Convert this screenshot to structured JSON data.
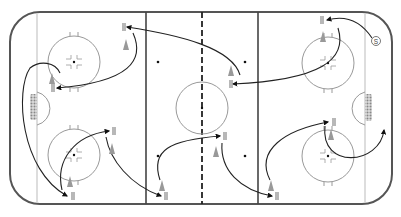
{
  "diagram": {
    "type": "hockey-rink-drill",
    "rink": {
      "x": 10,
      "y": 12,
      "width": 382,
      "height": 192,
      "corner_radius": 30
    },
    "lines": {
      "left_goal_line_x": 37,
      "right_goal_line_x": 365,
      "left_blue_line_x": 146,
      "right_blue_line_x": 258,
      "center_red_line_x": 202
    },
    "faceoff_circles": [
      {
        "id": "top-left",
        "cx": 74,
        "cy": 62,
        "r": 26
      },
      {
        "id": "bottom-left",
        "cx": 74,
        "cy": 155,
        "r": 26
      },
      {
        "id": "center",
        "cx": 202,
        "cy": 108,
        "r": 26
      },
      {
        "id": "top-right",
        "cx": 328,
        "cy": 63,
        "r": 26
      },
      {
        "id": "bottom-right",
        "cx": 328,
        "cy": 156,
        "r": 26
      }
    ],
    "neutral_dots": [
      {
        "x": 158,
        "y": 62
      },
      {
        "x": 158,
        "y": 156
      },
      {
        "x": 245,
        "y": 62
      },
      {
        "x": 245,
        "y": 156
      }
    ],
    "goals": [
      {
        "side": "left",
        "x": 30,
        "y": 94,
        "w": 7,
        "h": 26
      },
      {
        "side": "right",
        "x": 365,
        "y": 94,
        "w": 7,
        "h": 27
      }
    ],
    "start_marker": {
      "label": "S",
      "x": 373,
      "y": 41
    },
    "players": [
      {
        "x": 123,
        "y": 27
      },
      {
        "x": 53,
        "y": 88
      },
      {
        "x": 71,
        "y": 196
      },
      {
        "x": 112,
        "y": 131
      },
      {
        "x": 165,
        "y": 196
      },
      {
        "x": 228,
        "y": 84
      },
      {
        "x": 224,
        "y": 136
      },
      {
        "x": 276,
        "y": 196
      },
      {
        "x": 322,
        "y": 20
      },
      {
        "x": 332,
        "y": 122
      }
    ],
    "cones": [
      {
        "x": 126,
        "y": 44
      },
      {
        "x": 52,
        "y": 78
      },
      {
        "x": 70,
        "y": 181
      },
      {
        "x": 112,
        "y": 148
      },
      {
        "x": 162,
        "y": 185
      },
      {
        "x": 231,
        "y": 70
      },
      {
        "x": 216,
        "y": 151
      },
      {
        "x": 271,
        "y": 185
      },
      {
        "x": 323,
        "y": 36
      },
      {
        "x": 331,
        "y": 134
      }
    ],
    "colors": {
      "board": "#555555",
      "line": "#444444",
      "thin_line": "#aaaaaa",
      "circle": "#999999",
      "path": "#222222",
      "cone": "#999999",
      "net": "#888888"
    }
  }
}
